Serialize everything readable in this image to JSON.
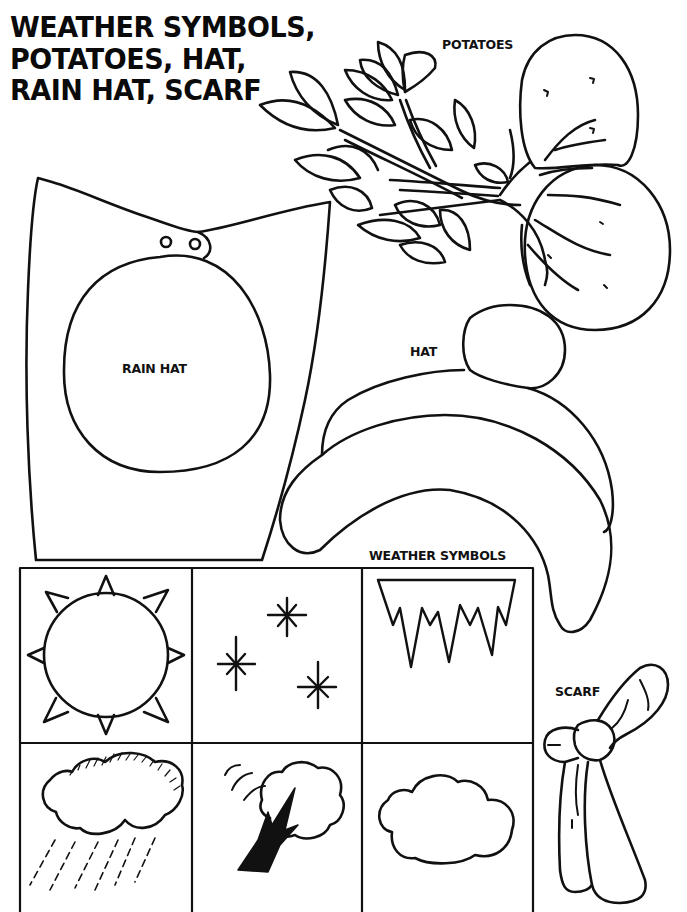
{
  "page": {
    "title_lines": [
      "WEATHER SYMBOLS,",
      "POTATOES, HAT,",
      "RAIN HAT, SCARF"
    ]
  },
  "labels": {
    "potatoes": "POTATOES",
    "rain_hat": "RAIN HAT",
    "hat": "HAT",
    "weather_symbols": "WEATHER SYMBOLS",
    "scarf": "SCARF"
  },
  "pieces": [
    {
      "id": "potatoes",
      "label": "POTATOES",
      "icon": "potato-plant-icon"
    },
    {
      "id": "rain_hat",
      "label": "RAIN HAT",
      "icon": "rain-hat-icon"
    },
    {
      "id": "hat",
      "label": "HAT",
      "icon": "winter-hat-icon"
    },
    {
      "id": "scarf",
      "label": "SCARF",
      "icon": "scarf-icon"
    }
  ],
  "weather_symbols": {
    "grid": {
      "rows": 2,
      "cols": 3
    },
    "cells": [
      {
        "row": 0,
        "col": 0,
        "icon": "sun-icon"
      },
      {
        "row": 0,
        "col": 1,
        "icon": "stars-icon"
      },
      {
        "row": 0,
        "col": 2,
        "icon": "icicles-icon"
      },
      {
        "row": 1,
        "col": 0,
        "icon": "rain-cloud-icon"
      },
      {
        "row": 1,
        "col": 1,
        "icon": "windy-tree-icon"
      },
      {
        "row": 1,
        "col": 2,
        "icon": "cloud-icon"
      }
    ]
  },
  "colors": {
    "ink": "#111111",
    "paper": "#ffffff"
  }
}
